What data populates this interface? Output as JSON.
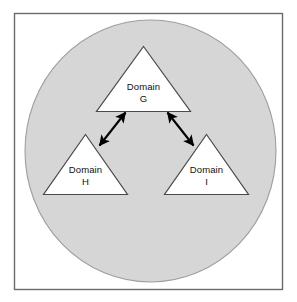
{
  "figure": {
    "frame": {
      "border_color": "#6b6b6b",
      "background_color": "#ffffff"
    },
    "container": {
      "shape": "circle",
      "fill_color": "#d6d6d6",
      "stroke_color": "#9a9a9a"
    },
    "nodes": [
      {
        "id": "domain-g",
        "shape": "triangle",
        "line1": "Domain",
        "line2": "G",
        "fill_color": "#ffffff",
        "stroke_color": "#4a4a4a",
        "position": "top"
      },
      {
        "id": "domain-h",
        "shape": "triangle",
        "line1": "Domain",
        "line2": "H",
        "fill_color": "#ffffff",
        "stroke_color": "#4a4a4a",
        "position": "bottom-left"
      },
      {
        "id": "domain-i",
        "shape": "triangle",
        "line1": "Domain",
        "line2": "I",
        "fill_color": "#ffffff",
        "stroke_color": "#4a4a4a",
        "position": "bottom-right"
      }
    ],
    "connectors": [
      {
        "id": "arrow-g-h",
        "from": "domain-g",
        "to": "domain-h",
        "style": "double-headed",
        "color": "#000000"
      },
      {
        "id": "arrow-g-i",
        "from": "domain-g",
        "to": "domain-i",
        "style": "double-headed",
        "color": "#000000"
      }
    ]
  }
}
